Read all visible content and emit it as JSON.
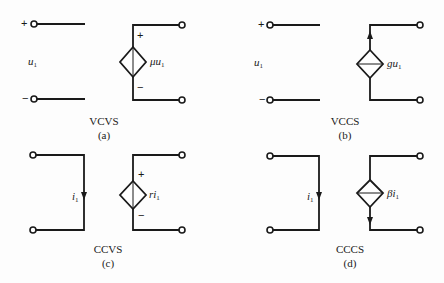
{
  "panels": [
    {
      "id": "a",
      "name": "VCVS",
      "caption": "(a)",
      "control_label": "u",
      "control_sub": "1",
      "control_type": "voltage",
      "input_plus": "+",
      "input_minus": "−",
      "source_gain": "μu",
      "source_sub": "1",
      "source_type": "voltage",
      "output_plus": "+",
      "output_minus": "−"
    },
    {
      "id": "b",
      "name": "VCCS",
      "caption": "(b)",
      "control_label": "u",
      "control_sub": "1",
      "control_type": "voltage",
      "input_plus": "+",
      "input_minus": "−",
      "source_gain": "gu",
      "source_sub": "1",
      "source_type": "current",
      "current_direction": "up"
    },
    {
      "id": "c",
      "name": "CCVS",
      "caption": "(c)",
      "control_label": "i",
      "control_sub": "1",
      "control_type": "current",
      "source_gain": "ri",
      "source_sub": "1",
      "source_type": "voltage",
      "output_plus": "+",
      "output_minus": "−"
    },
    {
      "id": "d",
      "name": "CCCS",
      "caption": "(d)",
      "control_label": "i",
      "control_sub": "1",
      "control_type": "current",
      "source_gain": "βi",
      "source_sub": "1",
      "source_type": "current",
      "current_direction": "down"
    }
  ]
}
